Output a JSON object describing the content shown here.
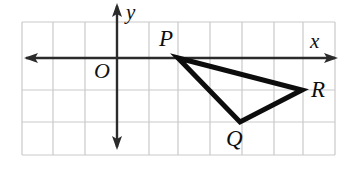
{
  "figure": {
    "type": "coordinate-plane-geometry-diagram",
    "width": 350,
    "height": 169,
    "background_color": "#ffffff"
  },
  "grid": {
    "color": "#c9c9c9",
    "line_width": 1.2,
    "cell_size": 32,
    "left": 22,
    "right": 335,
    "top": 22,
    "bottom": 155,
    "vertical_lines": [
      22,
      53,
      85,
      117,
      149,
      178,
      210,
      242,
      274,
      303,
      335
    ],
    "horizontal_lines": [
      22,
      58,
      90,
      122,
      155
    ]
  },
  "axes": {
    "color": "#2b2b2b",
    "line_width": 2.4,
    "x_axis": {
      "label": "x",
      "y": 58,
      "start_x": 24,
      "end_x": 338,
      "arrow_left": true,
      "arrow_right": true
    },
    "y_axis": {
      "label": "y",
      "x": 117,
      "start_y": 3,
      "end_y": 150,
      "arrow_up": true,
      "arrow_down": true
    },
    "origin_label": "O"
  },
  "triangle": {
    "stroke_color": "#0d0d0d",
    "stroke_width": 5,
    "vertices": [
      {
        "label": "P",
        "x": 178,
        "y": 58
      },
      {
        "label": "Q",
        "x": 240,
        "y": 122
      },
      {
        "label": "R",
        "x": 302,
        "y": 90
      }
    ]
  }
}
